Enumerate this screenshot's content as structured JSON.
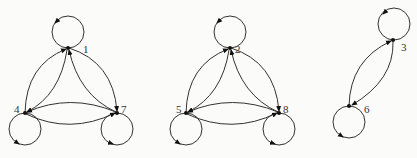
{
  "diagram": {
    "type": "directed-graph",
    "components": [
      {
        "nodes": [
          {
            "id": "1",
            "label": "1",
            "x": 68,
            "y": 48,
            "loop": "up"
          },
          {
            "id": "4",
            "label": "4",
            "x": 25,
            "y": 113,
            "loop": "down"
          },
          {
            "id": "7",
            "label": "7",
            "x": 117,
            "y": 113,
            "loop": "down"
          }
        ],
        "edges": [
          [
            "1",
            "1"
          ],
          [
            "4",
            "4"
          ],
          [
            "7",
            "7"
          ],
          [
            "4",
            "1"
          ],
          [
            "1",
            "4"
          ],
          [
            "1",
            "7"
          ],
          [
            "7",
            "1"
          ],
          [
            "4",
            "7"
          ],
          [
            "7",
            "4"
          ]
        ]
      },
      {
        "nodes": [
          {
            "id": "2",
            "label": "2",
            "x": 230,
            "y": 48,
            "loop": "up"
          },
          {
            "id": "5",
            "label": "5",
            "x": 186,
            "y": 113,
            "loop": "down"
          },
          {
            "id": "8",
            "label": "8",
            "x": 279,
            "y": 113,
            "loop": "down"
          }
        ],
        "edges": [
          [
            "2",
            "2"
          ],
          [
            "5",
            "5"
          ],
          [
            "8",
            "8"
          ],
          [
            "5",
            "2"
          ],
          [
            "2",
            "5"
          ],
          [
            "2",
            "8"
          ],
          [
            "8",
            "2"
          ],
          [
            "5",
            "8"
          ],
          [
            "8",
            "5"
          ]
        ]
      },
      {
        "nodes": [
          {
            "id": "3",
            "label": "3",
            "x": 393,
            "y": 40,
            "loop": "up"
          },
          {
            "id": "6",
            "label": "6",
            "x": 349,
            "y": 106,
            "loop": "down"
          }
        ],
        "edges": [
          [
            "3",
            "3"
          ],
          [
            "6",
            "6"
          ],
          [
            "6",
            "3"
          ],
          [
            "3",
            "6"
          ]
        ]
      }
    ]
  }
}
